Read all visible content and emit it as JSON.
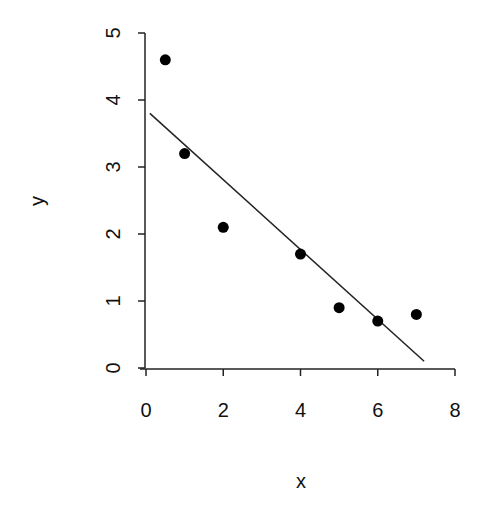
{
  "chart_data": {
    "type": "scatter",
    "title": "",
    "xlabel": "x",
    "ylabel": "y",
    "xlim": [
      0,
      8
    ],
    "ylim": [
      0,
      5
    ],
    "xticks": [
      0,
      2,
      4,
      6,
      8
    ],
    "yticks": [
      0,
      1,
      2,
      3,
      4,
      5
    ],
    "grid": false,
    "legend": null,
    "series": [
      {
        "name": "points",
        "type": "scatter",
        "x": [
          0.5,
          1,
          2,
          4,
          5,
          6,
          7
        ],
        "y": [
          4.6,
          3.2,
          2.1,
          1.7,
          0.9,
          0.7,
          0.8
        ]
      },
      {
        "name": "fitted line",
        "type": "line",
        "x": [
          0.1,
          7.2
        ],
        "y": [
          3.8,
          0.1
        ]
      }
    ]
  },
  "axes": {
    "x_label": "x",
    "y_label": "y",
    "x_tick_labels": [
      "0",
      "2",
      "4",
      "6",
      "8"
    ],
    "y_tick_labels": [
      "0",
      "1",
      "2",
      "3",
      "4",
      "5"
    ]
  }
}
